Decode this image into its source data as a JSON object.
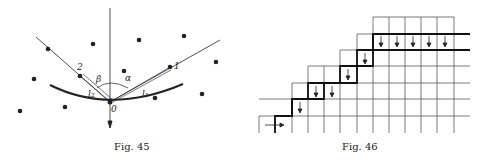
{
  "fig45": {
    "caption": "Fig. 45",
    "labels": {
      "p2": "2",
      "p1": "1",
      "beta": "β",
      "alpha": "α",
      "l2": "l₂",
      "l1": "l₁",
      "origin": "0"
    }
  },
  "fig46": {
    "caption": "Fig. 46"
  }
}
